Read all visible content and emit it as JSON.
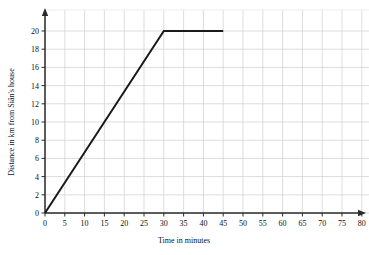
{
  "chart_data": {
    "type": "line",
    "title": "",
    "xlabel": "Time in minutes",
    "ylabel": "Distance in km from Siân's house",
    "xlim": [
      0,
      80
    ],
    "ylim": [
      0,
      20
    ],
    "xticks": [
      0,
      5,
      10,
      15,
      20,
      25,
      30,
      35,
      40,
      45,
      50,
      55,
      60,
      65,
      70,
      75,
      80
    ],
    "yticks": [
      0,
      2,
      4,
      6,
      8,
      10,
      12,
      14,
      16,
      18,
      20
    ],
    "xtick_labels": [
      "0",
      "5",
      "10",
      "15",
      "20",
      "25",
      "30",
      "35",
      "40",
      "45",
      "50",
      "55",
      "60",
      "65",
      "70",
      "75",
      "80"
    ],
    "ytick_labels": [
      "0",
      "2",
      "4",
      "6",
      "8",
      "10",
      "12",
      "14",
      "16",
      "18",
      "20"
    ],
    "grid": true,
    "legend": "none",
    "series": [
      {
        "name": "journey",
        "color": "#1a1a1a",
        "points": [
          {
            "x": 0,
            "y": 0
          },
          {
            "x": 30,
            "y": 20
          },
          {
            "x": 45,
            "y": 20
          }
        ]
      }
    ],
    "axis_color": "#2b2b2b",
    "grid_color": "#cfcfcf",
    "grid_minor_color": "#e2e2e2",
    "background": "#ffffff"
  }
}
